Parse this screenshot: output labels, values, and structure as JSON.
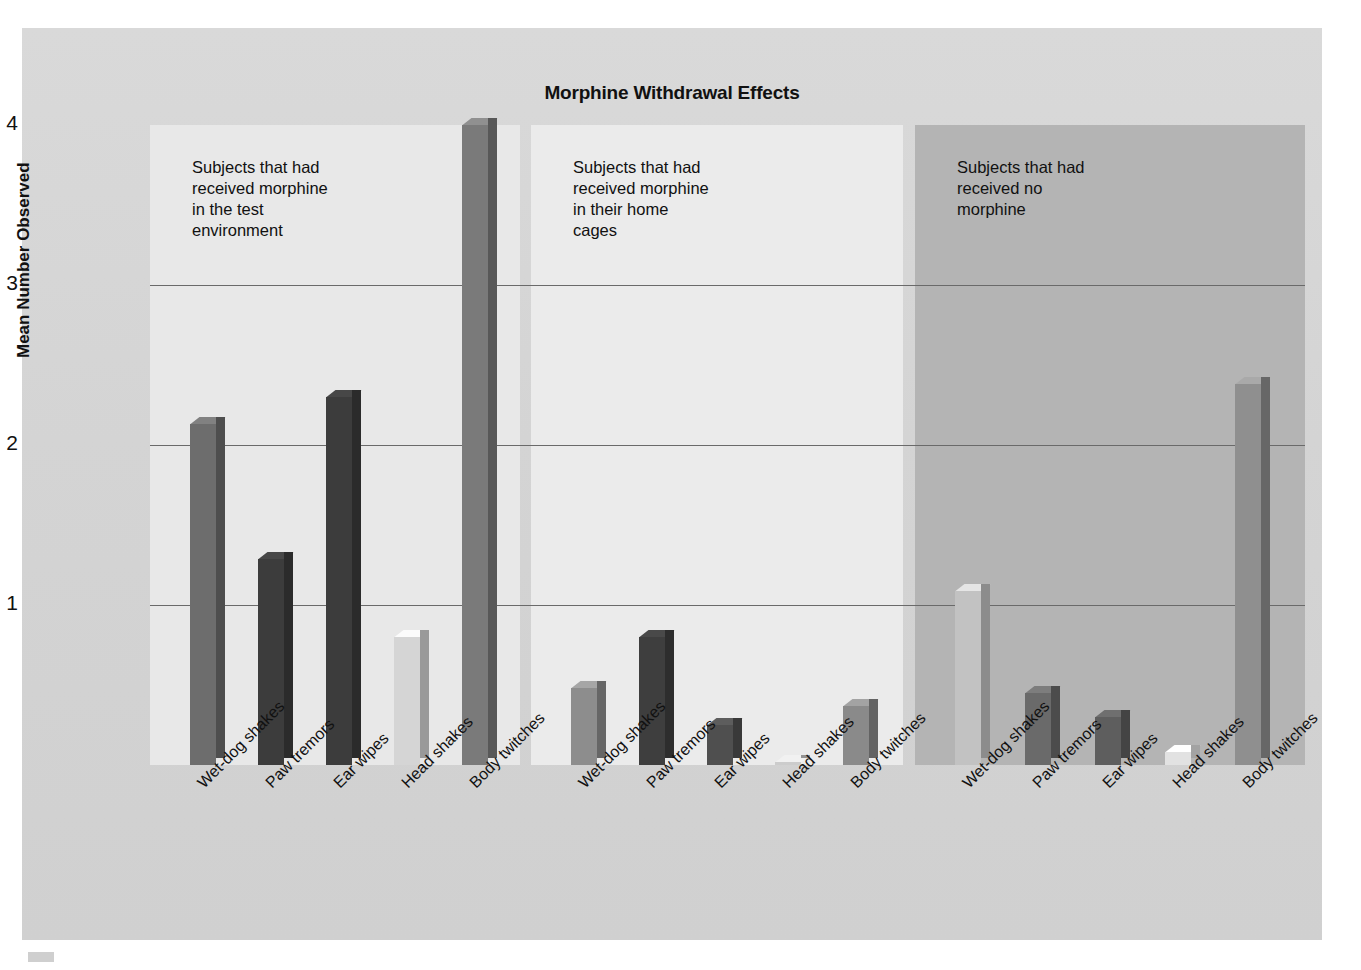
{
  "figure": {
    "title": "Morphine Withdrawal Effects"
  },
  "chart_data": {
    "type": "bar",
    "title": "Morphine Withdrawal Effects",
    "xlabel": "",
    "ylabel": "Mean Number Observed",
    "ylim": [
      0,
      4
    ],
    "yticks": [
      "1",
      "2",
      "3",
      "4"
    ],
    "grid": true,
    "legend_position": "none",
    "categories": [
      "Wet-dog shakes",
      "Paw tremors",
      "Ear wipes",
      "Head shakes",
      "Body twitches"
    ],
    "panels": [
      {
        "note": "Subjects that had\nreceived morphine\nin the test\nenvironment",
        "values": [
          2.13,
          1.29,
          2.3,
          0.8,
          4.0
        ],
        "bar_colors": [
          "#6d6d6d",
          "#3c3c3c",
          "#3c3c3c",
          "#d5d5d5",
          "#7a7a7a"
        ]
      },
      {
        "note": "Subjects that had\nreceived morphine\nin their home\ncages",
        "values": [
          0.48,
          0.8,
          0.25,
          0.02,
          0.37
        ],
        "bar_colors": [
          "#8d8d8d",
          "#3e3e3e",
          "#4f4f4f",
          "#cccccc",
          "#8a8a8a"
        ]
      },
      {
        "note": "Subjects that had\nreceived no\nmorphine",
        "values": [
          1.09,
          0.45,
          0.3,
          0.08,
          2.38
        ],
        "bar_colors": [
          "#c2c2c2",
          "#6a6a6a",
          "#5e5e5e",
          "#e2e2e2",
          "#8f8f8f"
        ]
      }
    ],
    "colors": {
      "panel1_bg": "#e8e8e8",
      "panel2_bg": "#ebebeb",
      "panel3_bg": "#b4b4b4",
      "figure_bg": "#d5d5d5",
      "gridline": "#6a6a6a",
      "text": "#111111"
    }
  }
}
